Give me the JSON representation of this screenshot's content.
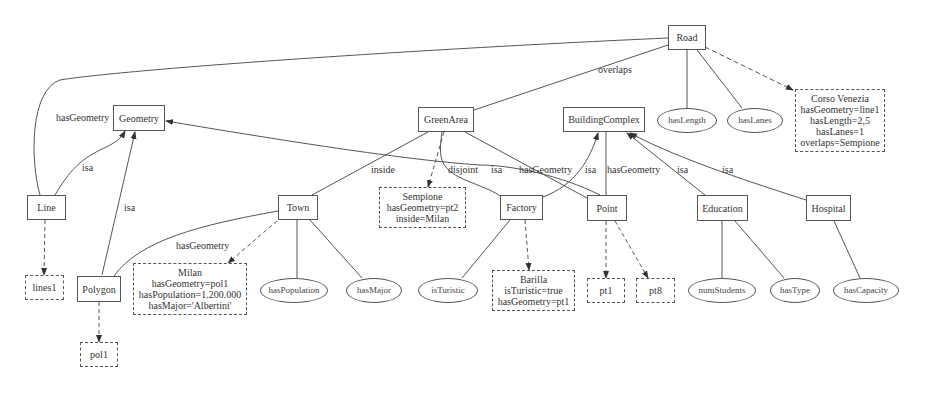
{
  "diagram": {
    "type": "ontology-graph",
    "classes": {
      "road": "Road",
      "geometry": "Geometry",
      "green_area": "GreenArea",
      "building_complex": "BuildingComplex",
      "line": "Line",
      "polygon": "Polygon",
      "town": "Town",
      "factory": "Factory",
      "point": "Point",
      "education": "Education",
      "hospital": "Hospital"
    },
    "attributes": {
      "has_length": "hasLength",
      "has_lanes": "hasLanes",
      "has_population": "hasPopulation",
      "has_major": "hasMajor",
      "is_turistic": "isTuristic",
      "num_students": "numStudents",
      "has_type": "hasType",
      "has_capacity": "hasCapacity"
    },
    "instances": {
      "corso_venezia": [
        "Corso Venezia",
        "hasGeometry=line1",
        "hasLength=2,5",
        "hasLanes=1",
        "overlaps=Sempione"
      ],
      "sempione": [
        "Sempione",
        "hasGeometry=pt2",
        "inside=Milan"
      ],
      "milan": [
        "Milan",
        "hasGeometry=pol1",
        "hasPopulation=1.200.000",
        "hasMajor='Albertini'"
      ],
      "barilla": [
        "Barilla",
        "isTuristic=true",
        "hasGeometry=pt1"
      ],
      "lines1": "lines1",
      "pol1": "pol1",
      "pt1": "pt1",
      "pt8": "pt8"
    },
    "edge_labels": {
      "overlaps": "overlaps",
      "has_geometry_line": "hasGeometry",
      "isa_line": "isa",
      "isa_polygon": "isa",
      "has_geometry_town": "hasGeometry",
      "inside": "inside",
      "disjoint": "disjoint",
      "isa_point": "isa",
      "has_geometry_factory": "hasGeometry",
      "isa_factory": "isa",
      "has_geometry_point": "hasGeometry",
      "isa_education": "isa",
      "isa_hospital": "isa"
    },
    "colors": {
      "line": "#555555",
      "background": "#ffffff",
      "text": "#333333"
    }
  }
}
